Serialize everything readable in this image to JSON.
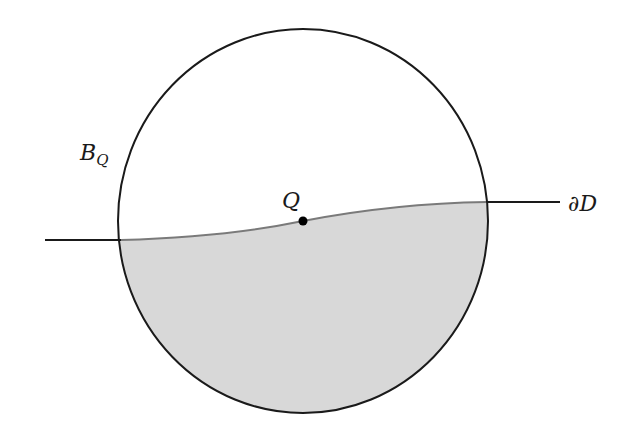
{
  "labels": {
    "ball": "B",
    "ball_subscript": "Q",
    "point": "Q",
    "boundary": "∂D"
  },
  "colors": {
    "stroke": "#1a1a1a",
    "fill_region": "#d8d8d8",
    "boundary_inside": "#7a7a7a",
    "background": "#ffffff"
  },
  "geometry": {
    "circle_center": [
      303,
      221
    ],
    "circle_rx": 185,
    "circle_ry": 192,
    "point_Q": [
      303,
      221
    ],
    "boundary_left_end": [
      45,
      240
    ],
    "boundary_right_end": [
      560,
      202
    ]
  }
}
